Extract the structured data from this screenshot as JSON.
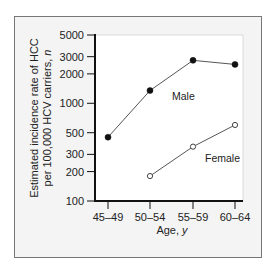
{
  "chart_data": {
    "type": "line",
    "title": "",
    "xlabel": "Age, ",
    "xlabel_italic": "y",
    "ylabel_lines": [
      "Estimated incidence rate of HCC",
      "per 100,000 HCV carriers, "
    ],
    "ylabel_italic": "n",
    "yscale": "log",
    "ylim": [
      100,
      5000
    ],
    "yticks": [
      100,
      200,
      300,
      500,
      1000,
      2000,
      3000,
      5000
    ],
    "categories": [
      "45–49",
      "50–54",
      "55–59",
      "60–64"
    ],
    "grid": false,
    "series": [
      {
        "name": "Male",
        "marker": "filled-circle",
        "values": [
          450,
          1350,
          2750,
          2500
        ]
      },
      {
        "name": "Female",
        "marker": "open-circle",
        "values": [
          null,
          180,
          360,
          600
        ]
      }
    ],
    "colors": {
      "line": "#555555",
      "marker": "#111111",
      "axis": "#111111",
      "panel_background": "#f4f4f4",
      "plot_background": "#ffffff",
      "frame": "#777777"
    }
  }
}
